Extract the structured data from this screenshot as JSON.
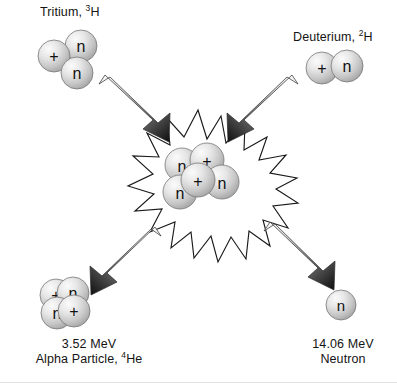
{
  "diagram": {
    "background_color": "#ffffff",
    "text_color": "#141414",
    "nucleon_fill_light": "#f2f2f2",
    "nucleon_fill_dark": "#9a9a9a",
    "nucleon_stroke": "#6e6e6e",
    "burst_stroke": "#1a1a1a",
    "arrow_tail_color": "#f0f0f0",
    "arrow_tip_color": "#111111"
  },
  "reactants": {
    "tritium": {
      "name": "Tritium",
      "symbol_mass": "3",
      "symbol_element": "H",
      "label_prefix": "Tritium, ",
      "nucleons": [
        {
          "glyph": "+",
          "kind": "proton"
        },
        {
          "glyph": "n",
          "kind": "neutron"
        },
        {
          "glyph": "n",
          "kind": "neutron"
        }
      ]
    },
    "deuterium": {
      "name": "Deuterium",
      "symbol_mass": "2",
      "symbol_element": "H",
      "label_prefix": "Deuterium, ",
      "nucleons": [
        {
          "glyph": "+",
          "kind": "proton"
        },
        {
          "glyph": "n",
          "kind": "neutron"
        }
      ]
    }
  },
  "fusion_core": {
    "nucleons": [
      {
        "glyph": "n",
        "kind": "neutron"
      },
      {
        "glyph": "+",
        "kind": "proton"
      },
      {
        "glyph": "+",
        "kind": "proton"
      },
      {
        "glyph": "n",
        "kind": "neutron"
      },
      {
        "glyph": "n",
        "kind": "neutron"
      }
    ]
  },
  "products": {
    "alpha": {
      "energy": "3.52 MeV",
      "name": "Alpha Particle",
      "symbol_mass": "4",
      "symbol_element": "He",
      "label_prefix": "Alpha Particle, ",
      "nucleons": [
        {
          "glyph": "+",
          "kind": "proton"
        },
        {
          "glyph": "n",
          "kind": "neutron"
        },
        {
          "glyph": "n",
          "kind": "neutron"
        },
        {
          "glyph": "+",
          "kind": "proton"
        }
      ]
    },
    "neutron": {
      "energy": "14.06 MeV",
      "name": "Neutron",
      "nucleons": [
        {
          "glyph": "n",
          "kind": "neutron"
        }
      ]
    }
  },
  "arrows": [
    {
      "id": "tritium-inbound",
      "direction": "down-right"
    },
    {
      "id": "deuterium-inbound",
      "direction": "down-left"
    },
    {
      "id": "alpha-outbound",
      "direction": "down-left"
    },
    {
      "id": "neutron-outbound",
      "direction": "down-right"
    }
  ]
}
